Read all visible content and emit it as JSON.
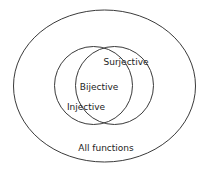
{
  "diagram": {
    "type": "venn",
    "background_color": "#ffffff",
    "stroke_color": "#3a3a3a",
    "text_color": "#232323",
    "universe": {
      "label": "All functions",
      "shape": "ellipse",
      "cx": 104.5,
      "cy": 86,
      "rx": 91,
      "ry": 76,
      "label_x": 106,
      "label_y": 148
    },
    "sets": [
      {
        "id": "injective",
        "label": "Injective",
        "shape": "circle",
        "cx": 93.5,
        "cy": 85.5,
        "r": 39,
        "label_x": 86,
        "label_y": 107
      },
      {
        "id": "surjective",
        "label": "Surjective",
        "shape": "circle",
        "cx": 114.5,
        "cy": 85.5,
        "r": 39,
        "label_x": 126,
        "label_y": 62
      }
    ],
    "intersections": [
      {
        "id": "bijective",
        "label": "Bijective",
        "of": "injective ∩ surjective",
        "label_x": 99,
        "label_y": 87
      }
    ]
  }
}
